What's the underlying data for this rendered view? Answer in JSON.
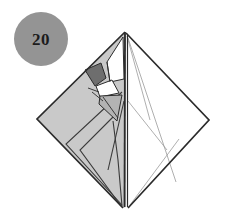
{
  "figure": {
    "kind": "origami-step-diagram",
    "step_badge": {
      "label": "20",
      "shape": "circle",
      "fill": "#949494",
      "text_color": "#1c1c1c"
    },
    "canvas": {
      "width": 227,
      "height": 210,
      "background": "#ffffff"
    },
    "palette": {
      "paper_light_gray": "#c9c9c9",
      "paper_mid_gray": "#b3b3b3",
      "paper_dark_gray": "#6e6e6e",
      "paper_white": "#ffffff",
      "outline_dark": "#2b2b2b",
      "fold_line": "#3a3a3a",
      "hint_line": "#9a9a9a"
    },
    "vertices": {
      "apex_top": [
        125,
        32
      ],
      "vertex_left": [
        37,
        119
      ],
      "vertex_right": [
        209,
        120
      ],
      "vertex_bottom": [
        123,
        208
      ],
      "spine_top": [
        125,
        32
      ],
      "spine_bottom": [
        126,
        207
      ]
    },
    "regions": [
      {
        "name": "left-front-panel",
        "fill": "paper_light_gray",
        "points": "125,32 37,119 123,208 126,207 126,33"
      },
      {
        "name": "right-back-panel",
        "fill": "paper_white",
        "points": "126,33 209,120 128,208 127,207"
      },
      {
        "name": "upper-dark-flap",
        "fill": "paper_dark_gray",
        "points": "85,70 101,63 106,78 95,86"
      },
      {
        "name": "white-wedge-upper",
        "fill": "paper_white",
        "points": "107,62 123,37 124,79 110,82"
      },
      {
        "name": "small-white-flap",
        "fill": "paper_white",
        "points": "96,86 112,80 119,93 103,97"
      },
      {
        "name": "mid-gray-flap",
        "fill": "paper_mid_gray",
        "points": "100,96 122,95 118,120 99,104"
      }
    ],
    "fold_lines": [
      {
        "name": "spine-center",
        "from": [
          125,
          32
        ],
        "to": [
          125,
          207
        ],
        "weight": "heavy"
      },
      {
        "name": "spine-inner",
        "from": [
          127,
          34
        ],
        "to": [
          127,
          207
        ],
        "weight": "medium"
      },
      {
        "name": "left-outer-edge",
        "from": [
          125,
          32
        ],
        "to": [
          37,
          119
        ],
        "weight": "heavy"
      },
      {
        "name": "left-bottom-edge",
        "from": [
          37,
          119
        ],
        "to": [
          123,
          208
        ],
        "weight": "heavy"
      },
      {
        "name": "right-outer-edge",
        "from": [
          126,
          33
        ],
        "to": [
          209,
          120
        ],
        "weight": "heavy"
      },
      {
        "name": "right-bottom-edge",
        "from": [
          209,
          120
        ],
        "to": [
          128,
          208
        ],
        "weight": "heavy"
      },
      {
        "name": "left-inner-fold-a",
        "from": [
          122,
          92
        ],
        "to": [
          66,
          144
        ]
      },
      {
        "name": "left-inner-fold-b",
        "from": [
          66,
          144
        ],
        "to": [
          122,
          205
        ]
      },
      {
        "name": "left-inner-fold-c",
        "from": [
          118,
          112
        ],
        "to": [
          80,
          150
        ]
      },
      {
        "name": "left-inner-fold-d",
        "from": [
          80,
          150
        ],
        "to": [
          121,
          206
        ]
      },
      {
        "name": "left-inner-fold-e",
        "from": [
          113,
          120
        ],
        "to": [
          118,
          160
        ]
      },
      {
        "name": "left-inner-fold-f",
        "from": [
          118,
          160
        ],
        "to": [
          122,
          206
        ]
      },
      {
        "name": "left-crease-long",
        "from": [
          124,
          100
        ],
        "to": [
          108,
          170
        ]
      },
      {
        "name": "apex-hint-left",
        "from": [
          124,
          36
        ],
        "to": [
          110,
          78
        ],
        "weight": "hint"
      },
      {
        "name": "apex-hint-right",
        "from": [
          127,
          36
        ],
        "to": [
          150,
          120
        ],
        "weight": "hint"
      },
      {
        "name": "right-hint-a",
        "from": [
          128,
          38
        ],
        "to": [
          175,
          182
        ],
        "weight": "hint"
      },
      {
        "name": "right-hint-b",
        "from": [
          128,
          100
        ],
        "to": [
          166,
          150
        ],
        "weight": "hint"
      },
      {
        "name": "right-hint-c",
        "from": [
          130,
          205
        ],
        "to": [
          178,
          140
        ],
        "weight": "hint"
      },
      {
        "name": "detail-a",
        "from": [
          85,
          70
        ],
        "to": [
          101,
          63
        ]
      },
      {
        "name": "detail-b",
        "from": [
          101,
          63
        ],
        "to": [
          106,
          78
        ]
      },
      {
        "name": "detail-c",
        "from": [
          106,
          78
        ],
        "to": [
          95,
          86
        ]
      },
      {
        "name": "detail-d",
        "from": [
          95,
          86
        ],
        "to": [
          85,
          70
        ]
      },
      {
        "name": "detail-e",
        "from": [
          96,
          86
        ],
        "to": [
          112,
          80
        ]
      },
      {
        "name": "detail-f",
        "from": [
          112,
          80
        ],
        "to": [
          119,
          93
        ]
      },
      {
        "name": "detail-g",
        "from": [
          119,
          93
        ],
        "to": [
          100,
          97
        ]
      },
      {
        "name": "detail-h",
        "from": [
          100,
          97
        ],
        "to": [
          96,
          86
        ]
      },
      {
        "name": "detail-i",
        "from": [
          100,
          96
        ],
        "to": [
          122,
          95
        ]
      },
      {
        "name": "detail-j",
        "from": [
          122,
          95
        ],
        "to": [
          117,
          121
        ]
      },
      {
        "name": "detail-k",
        "from": [
          117,
          121
        ],
        "to": [
          99,
          104
        ]
      },
      {
        "name": "detail-l",
        "from": [
          107,
          62
        ],
        "to": [
          123,
          37
        ]
      },
      {
        "name": "detail-m",
        "from": [
          110,
          82
        ],
        "to": [
          107,
          62
        ]
      },
      {
        "name": "detail-n",
        "from": [
          88,
          88
        ],
        "to": [
          99,
          92
        ]
      },
      {
        "name": "detail-o",
        "from": [
          92,
          92
        ],
        "to": [
          102,
          100
        ]
      }
    ]
  }
}
